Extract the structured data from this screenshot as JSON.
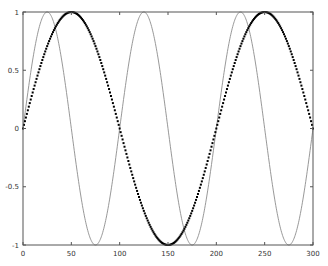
{
  "chart_data": {
    "type": "line",
    "title": "",
    "xlabel": "",
    "ylabel": "",
    "xlim": [
      0,
      300
    ],
    "ylim": [
      -1,
      1
    ],
    "grid": false,
    "legend": null,
    "x_ticks": [
      0,
      50,
      100,
      150,
      200,
      250,
      300
    ],
    "x_tick_labels": [
      "0",
      "50",
      "100",
      "150",
      "200",
      "250",
      "300"
    ],
    "y_ticks": [
      -1,
      -0.5,
      0,
      0.5,
      1
    ],
    "y_tick_labels": [
      "-1",
      "-0.5",
      "0",
      "0.5",
      "1"
    ],
    "series": [
      {
        "name": "sin(2πx/100)",
        "style": "line",
        "color": "#8c8c8c",
        "line_width": 0.9,
        "function": "sin",
        "period": 100,
        "amplitude": 1,
        "x_range": [
          0,
          300
        ],
        "key_points": [
          {
            "x": 0,
            "y": 0
          },
          {
            "x": 25,
            "y": 1
          },
          {
            "x": 50,
            "y": 0
          },
          {
            "x": 75,
            "y": -1
          },
          {
            "x": 100,
            "y": 0
          },
          {
            "x": 125,
            "y": 1
          },
          {
            "x": 150,
            "y": 0
          },
          {
            "x": 175,
            "y": -1
          },
          {
            "x": 200,
            "y": 0
          },
          {
            "x": 225,
            "y": 1
          },
          {
            "x": 250,
            "y": 0
          },
          {
            "x": 275,
            "y": -1
          },
          {
            "x": 300,
            "y": 0
          }
        ]
      },
      {
        "name": "sin(2πx/200)",
        "style": "points",
        "color": "#000000",
        "marker_size": 2,
        "function": "sin",
        "period": 200,
        "amplitude": 1,
        "x_range": [
          0,
          300
        ],
        "sample_step": 1,
        "key_points": [
          {
            "x": 0,
            "y": 0
          },
          {
            "x": 50,
            "y": 1
          },
          {
            "x": 100,
            "y": 0
          },
          {
            "x": 150,
            "y": -1
          },
          {
            "x": 200,
            "y": 0
          },
          {
            "x": 250,
            "y": 1
          },
          {
            "x": 300,
            "y": 0
          }
        ]
      }
    ],
    "frame_color": "#555555"
  },
  "layout": {
    "plot_left": 23,
    "plot_right": 313,
    "plot_top": 12,
    "plot_bottom": 245
  }
}
